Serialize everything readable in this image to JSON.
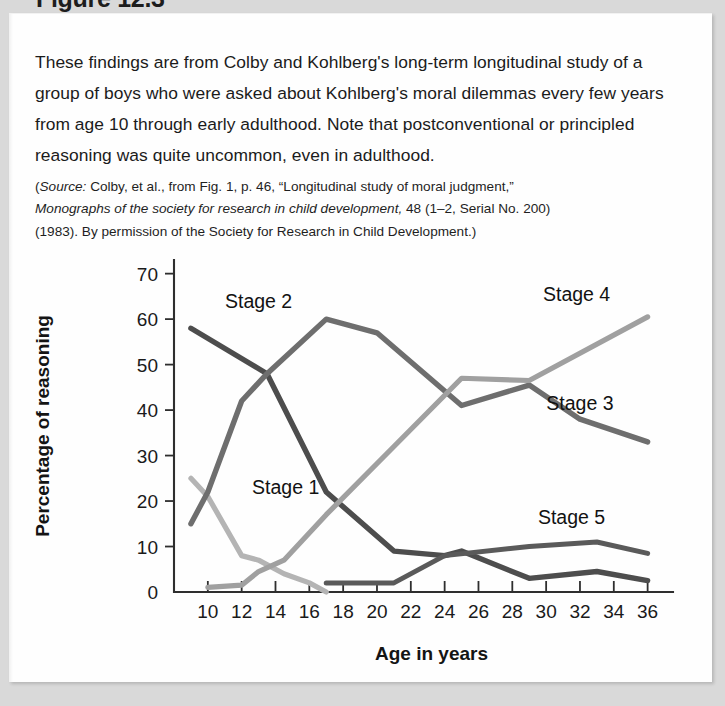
{
  "figure": {
    "heading": "Figure 12.3",
    "body_paragraph": "These findings are from Colby and Kohlberg's long-term longitudinal study of a group of boys who were asked about Kohlberg's moral dilemmas every few years from age 10 through early adulthood. Note that postconventional or principled reasoning was quite uncommon, even in adulthood.",
    "source_prefix": "Source:",
    "source_line1_rest": " Colby, et al., from Fig. 1, p. 46, “Longitudinal study of moral judgment,”",
    "source_italic_journal": "Monographs of the society for research in child development,",
    "source_line2_rest": " 48 (1–2, Serial No. 200)",
    "source_line3": "(1983). By permission of the Society for Research in Child Development.)"
  },
  "chart_data": {
    "type": "line",
    "title": "",
    "xlabel": "Age in years",
    "ylabel": "Percentage of reasoning",
    "xlim": [
      8,
      37.5
    ],
    "ylim": [
      0,
      73
    ],
    "grid": false,
    "legend_position": "inline-labels",
    "yticks": [
      0,
      10,
      20,
      30,
      40,
      50,
      60,
      70
    ],
    "xticks": [
      10,
      12,
      14,
      16,
      18,
      20,
      22,
      24,
      26,
      28,
      30,
      32,
      34,
      36
    ],
    "series": [
      {
        "name": "Stage 1",
        "color": "#b4b4b4",
        "width": 5.2,
        "label_x": 14.6,
        "label_y": 21.5,
        "x": [
          9.0,
          10.0,
          12.0,
          13.0,
          14.5,
          16.0,
          17.0
        ],
        "values": [
          25,
          21,
          8,
          7,
          4,
          2,
          0
        ]
      },
      {
        "name": "Stage 2",
        "color": "#4d4d4d",
        "width": 5.4,
        "label_x": 13.0,
        "label_y": 62.5,
        "x": [
          9.0,
          13.5,
          17.0,
          21.0,
          24.0,
          25.0,
          29.0,
          33.0,
          36.0
        ],
        "values": [
          58,
          48,
          22,
          9,
          8,
          9,
          3,
          4.5,
          2.5
        ]
      },
      {
        "name": "Stage 3",
        "color": "#6e6e6e",
        "width": 5.4,
        "label_x": 32.0,
        "label_y": 40.0,
        "x": [
          9.0,
          10.0,
          12.0,
          13.5,
          17.0,
          20.0,
          25.0,
          29.0,
          32.0,
          36.0
        ],
        "values": [
          15,
          22,
          42,
          48,
          60,
          57,
          41,
          45.5,
          38,
          33
        ]
      },
      {
        "name": "Stage 4",
        "color": "#a0a0a0",
        "width": 5.2,
        "label_x": 31.8,
        "label_y": 64.0,
        "x": [
          10.0,
          12.0,
          13.0,
          14.5,
          17.0,
          21.0,
          25.0,
          29.0,
          36.0
        ],
        "values": [
          1,
          1.5,
          4.5,
          7,
          17,
          32,
          47,
          46.5,
          60.5
        ]
      },
      {
        "name": "Stage 5",
        "color": "#5a5a5a",
        "width": 5.0,
        "label_x": 31.5,
        "label_y": 15.0,
        "x": [
          17.0,
          21.0,
          24.0,
          29.0,
          33.0,
          36.0
        ],
        "values": [
          2,
          2,
          8,
          10,
          11,
          8.5
        ]
      }
    ]
  }
}
